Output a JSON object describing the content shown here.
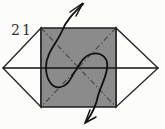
{
  "figure": {
    "step_number": "21",
    "colors": {
      "background": "#fcfcfa",
      "paper_white": "#fdfdfb",
      "paper_shaded": "#8b8b8b",
      "outline": "#1f1f1f",
      "crease": "#454545",
      "arrow": "#111111",
      "label": "#2e2e2e"
    }
  }
}
